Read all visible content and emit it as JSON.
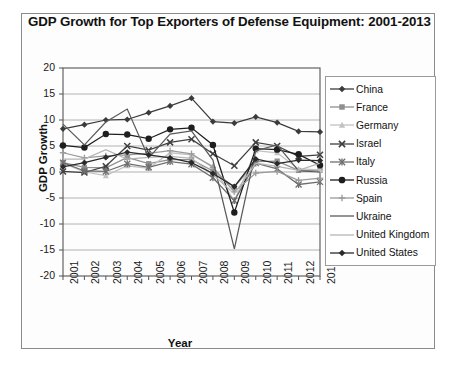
{
  "chart": {
    "title": "GDP Growth for Top Exporters of Defense Equipment: 2001-2013",
    "xlabel": "Year",
    "ylabel": "GDP Growth"
  },
  "yticks": [
    "20",
    "15",
    "10",
    "5",
    "0",
    "-5",
    "-10",
    "-15",
    "-20"
  ],
  "legend": [
    {
      "label": "China",
      "marker": "diamond",
      "color": "#3b3b3b"
    },
    {
      "label": "France",
      "marker": "square",
      "color": "#8f8f8f"
    },
    {
      "label": "Germany",
      "marker": "triangle",
      "color": "#c2c2c2"
    },
    {
      "label": "Israel",
      "marker": "x",
      "color": "#3f3f3f"
    },
    {
      "label": "Italy",
      "marker": "asterisk",
      "color": "#6e6e6e"
    },
    {
      "label": "Russia",
      "marker": "circle",
      "color": "#1e1e1e"
    },
    {
      "label": "Spain",
      "marker": "plus",
      "color": "#9a9a9a"
    },
    {
      "label": "Ukraine",
      "marker": "none",
      "color": "#5a5a5a"
    },
    {
      "label": "United Kingdom",
      "marker": "none",
      "color": "#b5b5b5"
    },
    {
      "label": "United States",
      "marker": "diamond",
      "color": "#2a2a2a"
    }
  ],
  "chart_data": {
    "type": "line",
    "title": "GDP Growth for Top Exporters of Defense Equipment: 2001-2013",
    "xlabel": "Year",
    "ylabel": "GDP Growth",
    "categories": [
      "2001",
      "2002",
      "2003",
      "2004",
      "2005",
      "2006",
      "2007",
      "2008",
      "2009",
      "2010",
      "2011",
      "2012",
      "2013"
    ],
    "x": [
      2001,
      2002,
      2003,
      2004,
      2005,
      2006,
      2007,
      2008,
      2009,
      2010,
      2011,
      2012,
      2013
    ],
    "ylim": [
      -20,
      20
    ],
    "yticks": [
      -20,
      -15,
      -10,
      -5,
      0,
      5,
      10,
      15,
      20
    ],
    "grid": true,
    "legend_position": "right",
    "series": [
      {
        "name": "China",
        "marker": "diamond",
        "color": "#3b3b3b",
        "values": [
          8.3,
          9.1,
          10.0,
          10.1,
          11.4,
          12.7,
          14.2,
          9.7,
          9.4,
          10.6,
          9.5,
          7.8,
          7.7
        ]
      },
      {
        "name": "France",
        "marker": "square",
        "color": "#8f8f8f",
        "values": [
          1.8,
          0.9,
          0.8,
          2.8,
          1.6,
          2.4,
          2.4,
          0.2,
          -2.9,
          2.0,
          2.1,
          0.3,
          0.3
        ]
      },
      {
        "name": "Germany",
        "marker": "triangle",
        "color": "#c2c2c2",
        "values": [
          1.7,
          0.0,
          -0.7,
          1.2,
          0.7,
          3.7,
          3.3,
          1.1,
          -5.6,
          4.1,
          3.7,
          0.6,
          0.4
        ]
      },
      {
        "name": "Israel",
        "marker": "x",
        "color": "#3f3f3f",
        "values": [
          0.1,
          -0.1,
          1.1,
          5.0,
          4.2,
          5.7,
          6.3,
          3.5,
          1.2,
          5.7,
          5.0,
          3.0,
          3.3
        ]
      },
      {
        "name": "Italy",
        "marker": "asterisk",
        "color": "#6e6e6e",
        "values": [
          1.8,
          0.2,
          0.1,
          1.6,
          0.9,
          2.0,
          1.5,
          -1.1,
          -5.5,
          1.7,
          0.6,
          -2.4,
          -1.9
        ]
      },
      {
        "name": "Russia",
        "marker": "circle",
        "color": "#1e1e1e",
        "values": [
          5.1,
          4.7,
          7.3,
          7.2,
          6.4,
          8.2,
          8.5,
          5.2,
          -7.8,
          4.5,
          4.3,
          3.4,
          1.3
        ]
      },
      {
        "name": "Spain",
        "marker": "plus",
        "color": "#9a9a9a",
        "values": [
          3.7,
          2.7,
          3.1,
          3.3,
          3.6,
          4.1,
          3.5,
          0.9,
          -3.8,
          -0.2,
          0.1,
          -1.6,
          -1.2
        ]
      },
      {
        "name": "Ukraine",
        "marker": "none",
        "color": "#5a5a5a",
        "values": [
          9.2,
          5.2,
          9.6,
          12.1,
          2.7,
          7.3,
          7.9,
          2.3,
          -14.8,
          4.1,
          5.2,
          0.2,
          0.0
        ]
      },
      {
        "name": "United Kingdom",
        "marker": "none",
        "color": "#b5b5b5",
        "values": [
          2.5,
          2.5,
          4.3,
          2.5,
          2.8,
          3.0,
          2.6,
          -0.5,
          -4.2,
          1.7,
          1.1,
          0.3,
          1.7
        ]
      },
      {
        "name": "United States",
        "marker": "diamond",
        "color": "#2a2a2a",
        "values": [
          1.0,
          1.8,
          2.8,
          3.8,
          3.3,
          2.7,
          1.8,
          -0.3,
          -2.8,
          2.5,
          1.6,
          2.3,
          2.2
        ]
      }
    ]
  }
}
